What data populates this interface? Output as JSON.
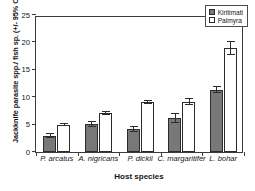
{
  "chart_data": {
    "type": "bar",
    "title": "",
    "xlabel": "Host species",
    "ylabel": "Jackknife parasite spp./ fish sp. (+/- 95% CL)",
    "categories": [
      "P. arcatus",
      "A. nigricans",
      "P. dickii",
      "C. margaritifer",
      "L. bohar"
    ],
    "series": [
      {
        "name": "Kiritimati",
        "color": "#787878",
        "values": [
          3.0,
          5.1,
          4.2,
          6.2,
          11.4
        ],
        "err_low": [
          0.4,
          0.5,
          0.6,
          0.9,
          0.7
        ],
        "err_high": [
          0.4,
          0.5,
          0.6,
          0.9,
          0.7
        ]
      },
      {
        "name": "Palmyra",
        "color": "#ffffff",
        "values": [
          5.0,
          7.1,
          9.1,
          9.2,
          19.0
        ],
        "err_low": [
          0.3,
          0.3,
          0.4,
          0.6,
          1.3
        ],
        "err_high": [
          0.3,
          0.3,
          0.4,
          0.6,
          1.3
        ]
      }
    ],
    "ylim": [
      0,
      25
    ],
    "yticks": [
      0,
      5,
      10,
      15,
      20,
      25
    ],
    "ytick_labels": [
      "0",
      "5",
      "10",
      "15",
      "20",
      "25"
    ],
    "grid": false,
    "legend_position": "top-right",
    "legend_entries": [
      "Kiritimati",
      "Palmyra"
    ]
  }
}
